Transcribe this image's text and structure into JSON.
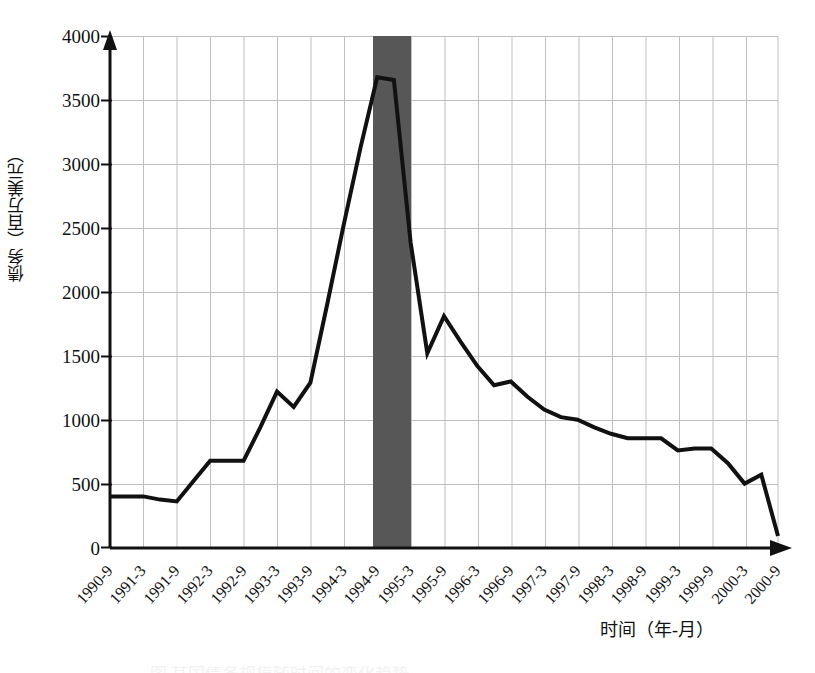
{
  "figure": {
    "caption_partial": "图 某国债务规模随时间的变化趋势",
    "background_color": "#ffffff",
    "line_color": "#111111",
    "grid_color": "#bfbfbf",
    "axis_color": "#111111",
    "shaded_band_color": "#575757"
  },
  "axes": {
    "y_title": "债务（百万美元）",
    "x_title": "时间（年-月）",
    "y_ticks": [
      "0",
      "500",
      "1000",
      "1500",
      "2000",
      "2500",
      "3000",
      "3500",
      "4000"
    ],
    "x_ticks": [
      "1990-9",
      "1991-3",
      "1991-9",
      "1992-3",
      "1992-9",
      "1993-3",
      "1993-9",
      "1994-3",
      "1994-9",
      "1995-3",
      "1995-9",
      "1996-3",
      "1996-9",
      "1997-3",
      "1997-9",
      "1998-3",
      "1998-9",
      "1999-3",
      "1999-9",
      "2000-3",
      "2000-9"
    ]
  },
  "annotations": {
    "shaded_band": {
      "label": "highlighted-period-band",
      "start_x_tick": "1994-9",
      "end_x_tick": "1995-3"
    }
  },
  "chart_data": {
    "type": "line",
    "title": "",
    "subtitle": "",
    "xlabel": "时间（年-月）",
    "ylabel": "债务（百万美元）",
    "ylim": [
      0,
      4000
    ],
    "ytick_step": 500,
    "grid": true,
    "legend": false,
    "x": [
      "1990-9",
      "1990-12",
      "1991-3",
      "1991-6",
      "1991-9",
      "1991-12",
      "1992-3",
      "1992-6",
      "1992-9",
      "1992-12",
      "1993-3",
      "1993-6",
      "1993-9",
      "1993-12",
      "1994-3",
      "1994-6",
      "1994-9",
      "1994-12",
      "1995-3",
      "1995-6",
      "1995-9",
      "1995-12",
      "1996-3",
      "1996-6",
      "1996-9",
      "1996-12",
      "1997-3",
      "1997-6",
      "1997-9",
      "1997-12",
      "1998-3",
      "1998-6",
      "1998-9",
      "1998-12",
      "1999-3",
      "1999-6",
      "1999-9",
      "1999-12",
      "2000-3",
      "2000-6",
      "2000-9"
    ],
    "series": [
      {
        "name": "债务",
        "values": [
          400,
          400,
          400,
          375,
          360,
          520,
          680,
          680,
          680,
          940,
          1220,
          1100,
          1290,
          1900,
          2530,
          3130,
          3680,
          3660,
          2390,
          1520,
          1810,
          1610,
          1420,
          1270,
          1300,
          1180,
          1080,
          1020,
          1000,
          940,
          890,
          855,
          855,
          855,
          760,
          775,
          775,
          660,
          500,
          570,
          90
        ]
      }
    ]
  }
}
